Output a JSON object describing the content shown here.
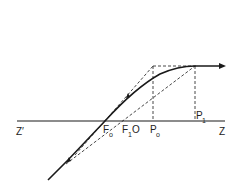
{
  "diagram": {
    "type": "optics-ray-diagram",
    "labels": {
      "z_prime": "Z′",
      "z": "Z",
      "f0_main": "F",
      "f0_sub": "o",
      "f1_main": "F",
      "f1_sub": "1",
      "o": "O",
      "p0_main": "P",
      "p0_sub": "o",
      "p1_main": "P",
      "p1_sub": "1"
    },
    "colors": {
      "stroke": "#1a1a1a",
      "background": "#ffffff"
    }
  }
}
